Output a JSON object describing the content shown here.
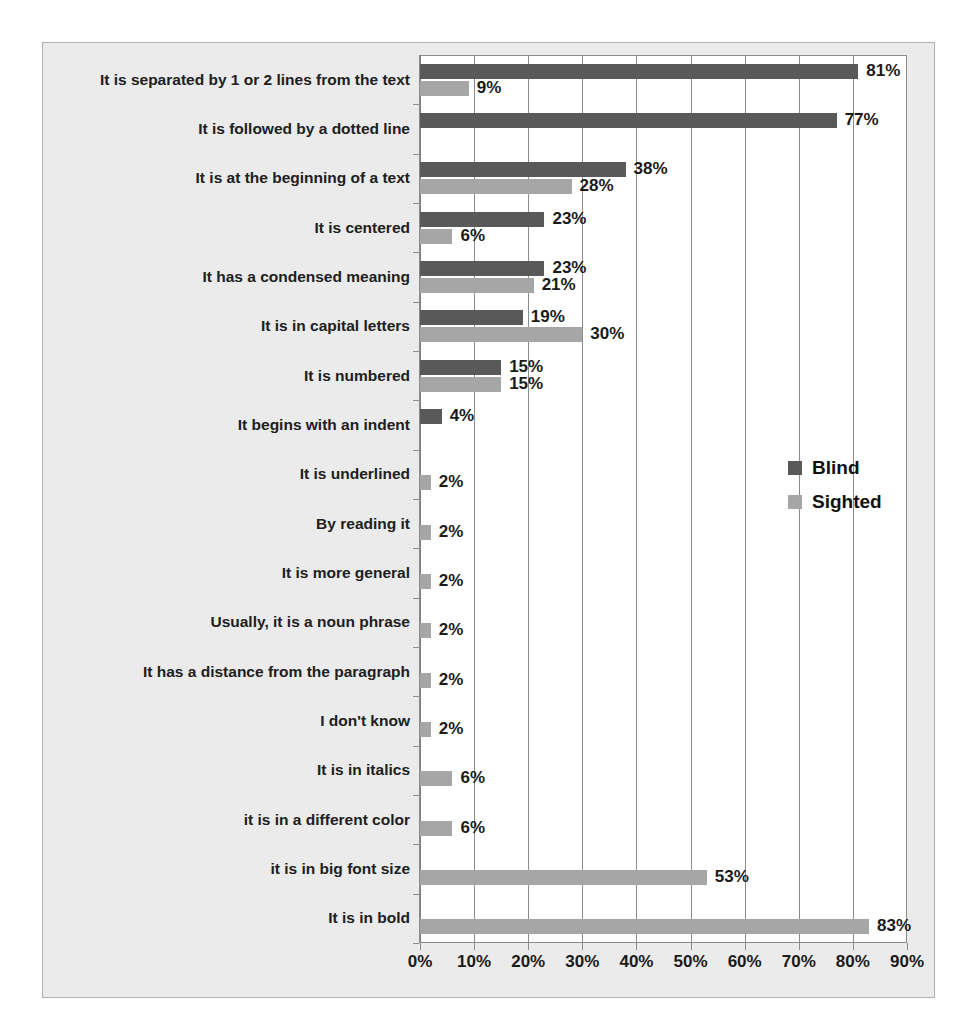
{
  "chart_data": {
    "type": "bar",
    "orientation": "horizontal",
    "title": "",
    "subtitle": "",
    "xlabel": "",
    "ylabel": "",
    "xlim": [
      0,
      90
    ],
    "xtick_labels": [
      "0%",
      "10%",
      "20%",
      "30%",
      "40%",
      "50%",
      "60%",
      "70%",
      "80%",
      "90%"
    ],
    "xtick_values": [
      0,
      10,
      20,
      30,
      40,
      50,
      60,
      70,
      80,
      90
    ],
    "grid": true,
    "grid_axis": "x",
    "legend_position": "middle-right",
    "categories": [
      "It is separated by 1 or 2 lines from the text",
      "It is followed by a dotted line",
      "It is at the beginning of a text",
      "It is centered",
      "It has a condensed meaning",
      "It is in capital letters",
      "It is numbered",
      "It begins with an indent",
      "It is underlined",
      "By reading it",
      "It is more general",
      "Usually, it is a noun phrase",
      "It has a distance from the paragraph",
      "I don't know",
      "It is in italics",
      "it is in a different color",
      "it is in big font size",
      "It is in bold"
    ],
    "series": [
      {
        "name": "Blind",
        "color": "#595959",
        "values": [
          81,
          77,
          38,
          23,
          23,
          19,
          15,
          4,
          null,
          null,
          null,
          null,
          null,
          null,
          null,
          null,
          null,
          null
        ],
        "labels": [
          "81%",
          "77%",
          "38%",
          "23%",
          "23%",
          "19%",
          "15%",
          "4%",
          "",
          "",
          "",
          "",
          "",
          "",
          "",
          "",
          "",
          ""
        ]
      },
      {
        "name": "Sighted",
        "color": "#a6a6a6",
        "values": [
          9,
          null,
          28,
          6,
          21,
          30,
          15,
          null,
          2,
          2,
          2,
          2,
          2,
          2,
          6,
          6,
          53,
          83
        ],
        "labels": [
          "9%",
          "",
          "28%",
          "6%",
          "21%",
          "30%",
          "15%",
          "",
          "2%",
          "2%",
          "2%",
          "2%",
          "2%",
          "2%",
          "6%",
          "6%",
          "53%",
          "83%"
        ]
      }
    ]
  },
  "legend": {
    "items": [
      {
        "label": "Blind",
        "color": "#595959"
      },
      {
        "label": "Sighted",
        "color": "#a6a6a6"
      }
    ]
  },
  "colors": {
    "blind": "#595959",
    "sighted": "#a6a6a6",
    "plot_background": "#ffffff",
    "chart_background": "#ebebeb",
    "gridline": "#8c8c8c",
    "text": "#1a1a1a"
  }
}
